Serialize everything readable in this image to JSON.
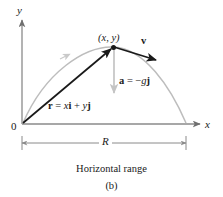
{
  "figure": {
    "caption_title": "Horizontal range",
    "caption_part": "(b)",
    "axes": {
      "y_label": "y",
      "x_label": "x",
      "origin_label": "0"
    },
    "annotations": {
      "point_label": "(x, y)",
      "velocity_vector": "v",
      "acceleration_label_vector": "a",
      "acceleration_label_equals": " = −",
      "acceleration_label_g": "g",
      "acceleration_label_j": "j",
      "position_label_r": "r",
      "position_label_equals": " = ",
      "position_label_x": "x",
      "position_label_i": "i",
      "position_label_plus": " + ",
      "position_label_y": "y",
      "position_label_j": "j",
      "range_label": "R"
    },
    "colors": {
      "axis": "#8a8a8a",
      "trajectory": "#b3b3b3",
      "vector_dark": "#1a1a1a",
      "vector_light": "#c4c4c4",
      "dimension": "#8a8a8a",
      "text": "#1a1a1a",
      "background": "#ffffff"
    }
  }
}
